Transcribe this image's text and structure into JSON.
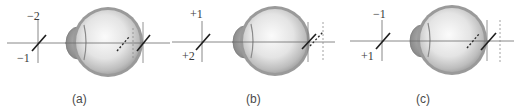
{
  "figure": {
    "type": "optical-diagram",
    "colors": {
      "axis_line": "#6b6b6b",
      "focal_line_solid": "#1e1e1e",
      "focal_line_dashed": "#2a2a2a",
      "eye_outer": "#8f8f8f",
      "eye_inner": "#d6d6d6",
      "eye_highlight": "#f7f7f7",
      "cornea": "#9a9a9a",
      "retina_marker": "#7a7a7a",
      "text": "#3a3a3a"
    },
    "panels": [
      {
        "id": "a",
        "caption": "(a)",
        "vertical_meridian_label": "−2",
        "oblique_meridian_label": "−1",
        "focal_condition": "both focal lines in front of retina"
      },
      {
        "id": "b",
        "caption": "(b)",
        "vertical_meridian_label": "+1",
        "oblique_meridian_label": "+2",
        "focal_condition": "both focal lines behind retina"
      },
      {
        "id": "c",
        "caption": "(c)",
        "vertical_meridian_label": "−1",
        "oblique_meridian_label": "+1",
        "focal_condition": "one focal line in front, one behind retina (mixed)"
      }
    ]
  }
}
